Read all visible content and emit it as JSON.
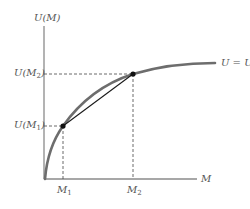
{
  "diagram": {
    "y_axis_label": "U(M)",
    "x_axis_label": "M",
    "curve_label": "U = U(M)",
    "y_ticks": [
      {
        "base": "U(M",
        "sub": "2",
        "close": ")"
      },
      {
        "base": "U(M",
        "sub": "1",
        "close": ")"
      }
    ],
    "x_ticks": [
      {
        "base": "M",
        "sub": "1"
      },
      {
        "base": "M",
        "sub": "2"
      }
    ],
    "points": [
      {
        "name": "point-m1",
        "x": 63,
        "y": 126
      },
      {
        "name": "point-m2",
        "x": 133,
        "y": 74
      }
    ],
    "colors": {
      "curve": "#6d6d6d",
      "axes": "#8a8a8a",
      "chord": "#1a1a1a",
      "dashed": "#444444",
      "text": "#555555"
    }
  }
}
